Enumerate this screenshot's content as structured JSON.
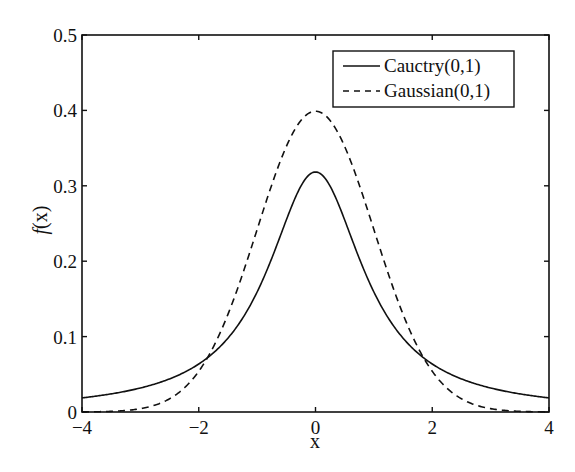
{
  "chart_data": {
    "type": "line",
    "title": "",
    "xlabel": "x",
    "ylabel": "f(x)",
    "xlim": [
      -4,
      4
    ],
    "ylim": [
      0,
      0.5
    ],
    "xticks": [
      -4,
      -2,
      0,
      2,
      4
    ],
    "xtick_labels": [
      "−4",
      "−2",
      "0",
      "2",
      "4"
    ],
    "yticks": [
      0,
      0.1,
      0.2,
      0.3,
      0.4,
      0.5
    ],
    "ytick_labels": [
      "0",
      "0.1",
      "0.2",
      "0.3",
      "0.4",
      "0.5"
    ],
    "grid": false,
    "legend_position": "upper right",
    "x": [
      -4,
      -3.5,
      -3,
      -2.5,
      -2,
      -1.75,
      -1.5,
      -1.25,
      -1,
      -0.75,
      -0.5,
      -0.25,
      0,
      0.25,
      0.5,
      0.75,
      1,
      1.25,
      1.5,
      1.75,
      2,
      2.5,
      3,
      3.5,
      4
    ],
    "series": [
      {
        "name": "Cauctry(0,1)",
        "style": "solid",
        "color": "#111111",
        "values": [
          0.0187,
          0.0241,
          0.0318,
          0.0439,
          0.0637,
          0.0782,
          0.0979,
          0.1243,
          0.1592,
          0.2037,
          0.2546,
          0.2996,
          0.3183,
          0.2996,
          0.2546,
          0.2037,
          0.1592,
          0.1243,
          0.0979,
          0.0782,
          0.0637,
          0.0439,
          0.0318,
          0.0241,
          0.0187
        ]
      },
      {
        "name": "Gaussian(0,1)",
        "style": "dashed",
        "color": "#111111",
        "values": [
          0.0001,
          0.0009,
          0.0044,
          0.0175,
          0.054,
          0.0863,
          0.1295,
          0.1826,
          0.242,
          0.3011,
          0.3521,
          0.3867,
          0.3989,
          0.3867,
          0.3521,
          0.3011,
          0.242,
          0.1826,
          0.1295,
          0.0863,
          0.054,
          0.0175,
          0.0044,
          0.0009,
          0.0001
        ]
      }
    ]
  },
  "legend": {
    "items": [
      {
        "label": "Cauctry(0,1)",
        "style": "solid"
      },
      {
        "label": "Gaussian(0,1)",
        "style": "dashed"
      }
    ]
  },
  "axes": {
    "xlabel": "x",
    "ylabel_italic": "f",
    "ylabel_rest": "(x)"
  }
}
